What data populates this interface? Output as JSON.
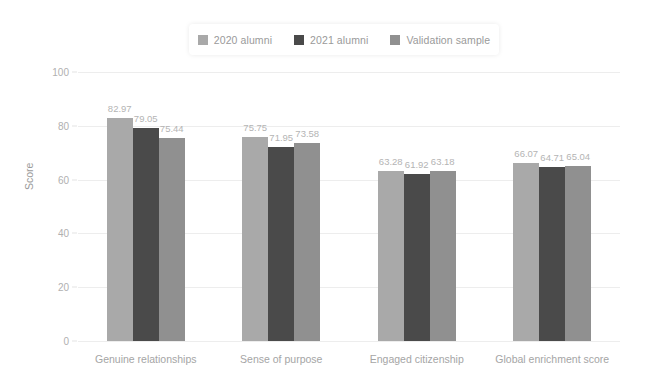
{
  "chart_data": {
    "type": "bar",
    "title": "",
    "xlabel": "",
    "ylabel": "Score",
    "ylim": [
      0,
      100
    ],
    "yticks": [
      0,
      20,
      40,
      60,
      80,
      100
    ],
    "grid": true,
    "legend_position": "top",
    "categories": [
      "Genuine relationships",
      "Sense of purpose",
      "Engaged citizenship",
      "Global enrichment score"
    ],
    "series": [
      {
        "name": "2020 alumni",
        "color": "#a9a9a9",
        "values": [
          82.97,
          75.75,
          63.28,
          66.07
        ],
        "labels": [
          "82.97",
          "75.75",
          "63.28",
          "66.07"
        ]
      },
      {
        "name": "2021 alumni",
        "color": "#4a4a4a",
        "values": [
          79.05,
          71.95,
          61.92,
          64.71
        ],
        "labels": [
          "79.05",
          "71.95",
          "61.92",
          "64.71"
        ]
      },
      {
        "name": "Validation sample",
        "color": "#909090",
        "values": [
          75.44,
          73.58,
          63.18,
          65.04
        ],
        "labels": [
          "75.44",
          "73.58",
          "63.18",
          "65.04"
        ]
      }
    ]
  },
  "legend": {
    "items": [
      {
        "label": "2020 alumni",
        "color": "#a9a9a9"
      },
      {
        "label": "2021 alumni",
        "color": "#4a4a4a"
      },
      {
        "label": "Validation sample",
        "color": "#909090"
      }
    ]
  },
  "axis": {
    "y_title": "Score",
    "y_tick_labels": [
      "100",
      "80",
      "60",
      "40",
      "20",
      "0"
    ]
  },
  "colors": {
    "background": "#ffffff",
    "gridline": "#ededed",
    "tick_text": "#b0b0b0",
    "category_text": "#a5a5a5",
    "value_text": "#b4b4b4",
    "legend_text": "#9a9a9a"
  }
}
